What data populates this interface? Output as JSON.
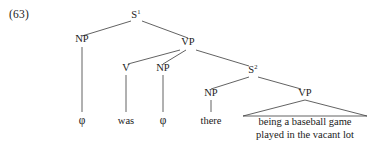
{
  "figure": {
    "example_number": "(63)",
    "type": "syntax-tree",
    "ink_color": "#1a1a1a"
  },
  "nodes": {
    "s1": {
      "label": "S",
      "superscript": "1"
    },
    "np_subject": {
      "label": "NP"
    },
    "vp_matrix": {
      "label": "VP"
    },
    "v": {
      "label": "V"
    },
    "np_object": {
      "label": "NP"
    },
    "s2": {
      "label": "S",
      "superscript": "2"
    },
    "np_embedded": {
      "label": "NP"
    },
    "vp_embedded": {
      "label": "VP"
    }
  },
  "terminals": {
    "subject_empty": "φ",
    "verb": "was",
    "object_empty": "φ",
    "expletive": "there",
    "predicate_line1": "being a baseball game",
    "predicate_line2": "played in the  vacant lot"
  }
}
